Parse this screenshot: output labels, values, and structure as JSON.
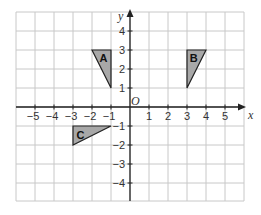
{
  "diagram": {
    "type": "coordinate-grid",
    "x_range": [
      -6,
      6
    ],
    "y_range": [
      -5,
      5
    ],
    "x_axis_label": "x",
    "y_axis_label": "y",
    "origin_label": "O",
    "x_tick_labels": [
      {
        "value": -5,
        "text": "−5"
      },
      {
        "value": -4,
        "text": "−4"
      },
      {
        "value": -3,
        "text": "−3"
      },
      {
        "value": -2,
        "text": "−2"
      },
      {
        "value": -1,
        "text": "−1"
      },
      {
        "value": 1,
        "text": "1"
      },
      {
        "value": 2,
        "text": "2"
      },
      {
        "value": 3,
        "text": "3"
      },
      {
        "value": 4,
        "text": "4"
      },
      {
        "value": 5,
        "text": "5"
      }
    ],
    "y_tick_labels": [
      {
        "value": 4,
        "text": "4"
      },
      {
        "value": 3,
        "text": "3"
      },
      {
        "value": 2,
        "text": "2"
      },
      {
        "value": 1,
        "text": "1"
      },
      {
        "value": -1,
        "text": "−1"
      },
      {
        "value": -2,
        "text": "−2"
      },
      {
        "value": -3,
        "text": "−3"
      },
      {
        "value": -4,
        "text": "−4"
      }
    ],
    "shapes": [
      {
        "label": "A",
        "vertices": [
          [
            -2,
            3
          ],
          [
            -1,
            3
          ],
          [
            -1,
            1
          ]
        ],
        "label_at": [
          -1.4,
          2.6
        ],
        "fill": "#a8a8a8"
      },
      {
        "label": "B",
        "vertices": [
          [
            3,
            3
          ],
          [
            4,
            3
          ],
          [
            3,
            1
          ]
        ],
        "label_at": [
          3.35,
          2.6
        ],
        "fill": "#a8a8a8"
      },
      {
        "label": "C",
        "vertices": [
          [
            -3,
            -1
          ],
          [
            -1,
            -1
          ],
          [
            -3,
            -2
          ]
        ],
        "label_at": [
          -2.6,
          -1.45
        ],
        "fill": "#a8a8a8"
      }
    ]
  }
}
